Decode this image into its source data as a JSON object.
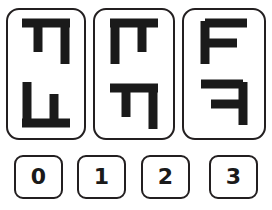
{
  "puzzle": {
    "kind": "visual-analogy-multiple-choice",
    "stroke_color": "#1a1a1a",
    "border_color": "#231f20",
    "background_color": "#ffffff",
    "cards": [
      {
        "index": 0,
        "name": "option-card-0",
        "glyphs": [
          {
            "slot": "top",
            "icon_name": "pi-shape-icon",
            "description": "horizontal top bar with a short left leg and a long right leg hanging down"
          },
          {
            "slot": "bottom",
            "icon_name": "inverted-pi-shape-icon",
            "description": "horizontal bottom bar with a long left leg and a short right leg rising up"
          }
        ]
      },
      {
        "index": 1,
        "name": "option-card-1",
        "glyphs": [
          {
            "slot": "top",
            "icon_name": "pi-shape-icon",
            "description": "horizontal top bar with a long left leg and a short right leg hanging down"
          },
          {
            "slot": "bottom",
            "icon_name": "pi-shape-icon",
            "description": "horizontal top bar with a short left leg and a long right leg hanging down"
          }
        ]
      },
      {
        "index": 2,
        "name": "option-card-2",
        "glyphs": [
          {
            "slot": "top",
            "icon_name": "letter-f-icon",
            "description": "capital letter F: vertical stem on the left with top bar and middle bar to the right"
          },
          {
            "slot": "bottom",
            "icon_name": "mirrored-letter-f-icon",
            "description": "horizontally mirrored capital letter F: vertical stem on the right with top bar and middle bar to the left"
          }
        ]
      }
    ],
    "answer_buttons": [
      {
        "value": "0",
        "name": "answer-button-0"
      },
      {
        "value": "1",
        "name": "answer-button-1"
      },
      {
        "value": "2",
        "name": "answer-button-2"
      },
      {
        "value": "3",
        "name": "answer-button-3"
      }
    ]
  }
}
